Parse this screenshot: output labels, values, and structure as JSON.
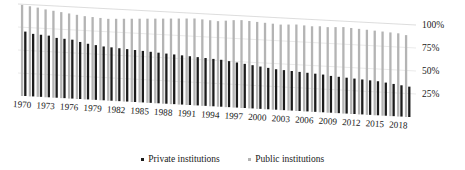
{
  "chart_data": {
    "type": "bar",
    "title": "",
    "subtitle": "",
    "xlabel": "",
    "ylabel": "",
    "ylim": [
      0,
      100
    ],
    "y_tick_labels": [
      "25%",
      "50%",
      "75%",
      "100%"
    ],
    "y_tick_values": [
      25,
      50,
      75,
      100
    ],
    "grid": true,
    "legend_position": "bottom",
    "perspective": "3d-tilted",
    "x_tick_label_step": 3,
    "categories": [
      "1970",
      "1971",
      "1972",
      "1973",
      "1974",
      "1975",
      "1976",
      "1977",
      "1978",
      "1979",
      "1980",
      "1981",
      "1982",
      "1983",
      "1984",
      "1985",
      "1986",
      "1987",
      "1988",
      "1989",
      "1990",
      "1991",
      "1992",
      "1993",
      "1994",
      "1995",
      "1996",
      "1997",
      "1998",
      "1999",
      "2000",
      "2001",
      "2002",
      "2003",
      "2004",
      "2005",
      "2006",
      "2007",
      "2008",
      "2009",
      "2010",
      "2011",
      "2012",
      "2013",
      "2014",
      "2015",
      "2016",
      "2017",
      "2018",
      "2019"
    ],
    "visible_x_tick_labels": [
      "1970",
      "1973",
      "1976",
      "1979",
      "1982",
      "1985",
      "1988",
      "1991",
      "1994",
      "1997",
      "2000",
      "2003",
      "2006",
      "2009",
      "2012",
      "2015",
      "2018"
    ],
    "series": [
      {
        "name": "Private institutions",
        "color": "#1c1c1c",
        "values": [
          70.0,
          68.0,
          67.5,
          67.0,
          65.0,
          64.5,
          64.0,
          62.0,
          60.5,
          59.5,
          58.5,
          58.0,
          57.5,
          57.0,
          56.5,
          56.0,
          55.5,
          55.0,
          54.5,
          54.0,
          53.5,
          53.0,
          52.5,
          52.0,
          51.5,
          51.0,
          50.0,
          49.0,
          48.0,
          47.0,
          46.0,
          45.0,
          44.0,
          43.5,
          43.0,
          42.5,
          42.0,
          41.5,
          41.0,
          40.0,
          39.5,
          39.0,
          38.5,
          38.0,
          37.5,
          37.0,
          36.0,
          35.0,
          34.0,
          33.0
        ]
      },
      {
        "name": "Public institutions",
        "color": "#b4b4b4",
        "values": [
          99.0,
          98.0,
          97.0,
          95.5,
          94.5,
          93.5,
          92.5,
          91.5,
          90.5,
          90.0,
          89.5,
          89.0,
          89.5,
          90.0,
          90.5,
          91.0,
          91.5,
          92.0,
          92.5,
          93.0,
          93.5,
          94.0,
          94.5,
          94.0,
          93.5,
          93.0,
          94.0,
          95.0,
          95.5,
          95.0,
          94.5,
          94.0,
          93.5,
          93.0,
          93.5,
          94.0,
          93.5,
          93.0,
          93.5,
          93.0,
          93.5,
          94.0,
          93.5,
          93.0,
          92.5,
          92.0,
          91.5,
          91.0,
          90.5,
          89.0
        ]
      }
    ]
  },
  "legend": {
    "items": [
      {
        "label": "Private institutions",
        "color": "#1c1c1c",
        "name": "legend-item-private"
      },
      {
        "label": "Public institutions",
        "color": "#b4b4b4",
        "name": "legend-item-public"
      }
    ]
  },
  "colors": {
    "private": "#1c1c1c",
    "public": "#b4b4b4",
    "gridline": "#d9d9d9",
    "axis_text": "#1a1a1a",
    "background": "#ffffff"
  }
}
